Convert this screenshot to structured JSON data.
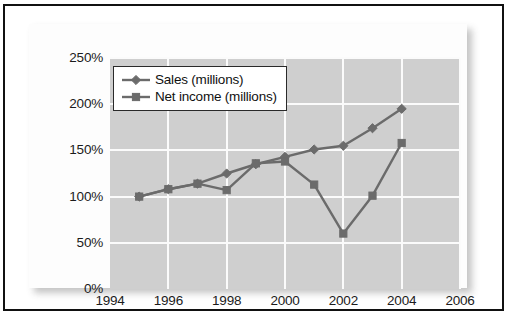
{
  "chart_data": {
    "type": "line",
    "title": "",
    "subtitle": "",
    "xlabel": "",
    "ylabel": "",
    "x": [
      1995,
      1996,
      1997,
      1998,
      1999,
      2000,
      2001,
      2002,
      2003,
      2004
    ],
    "xlim": [
      1994,
      2006
    ],
    "ylim": [
      0,
      250
    ],
    "xticks": [
      "1994",
      "1996",
      "1998",
      "2000",
      "2002",
      "2004",
      "2006"
    ],
    "xtick_values": [
      1994,
      1996,
      1998,
      2000,
      2002,
      2004,
      2006
    ],
    "yticks": [
      "0%",
      "50%",
      "100%",
      "150%",
      "200%",
      "250%"
    ],
    "ytick_values": [
      0,
      50,
      100,
      150,
      200,
      250
    ],
    "grid": true,
    "grid_color": "#fbfbfb",
    "plot_background": "#cfcfcf",
    "legend_position": "top-left",
    "series": [
      {
        "name": "Sales (millions)",
        "marker": "diamond",
        "color": "#6b6b6b",
        "values": [
          100,
          108,
          114,
          125,
          135,
          143,
          151,
          155,
          174,
          195
        ]
      },
      {
        "name": "Net income (millions)",
        "marker": "square",
        "color": "#6b6b6b",
        "values": [
          100,
          108,
          114,
          107,
          136,
          138,
          113,
          60,
          101,
          158
        ]
      }
    ]
  },
  "chart": {
    "legend": {
      "entries": [
        {
          "label": "Sales (millions)",
          "marker": "diamond"
        },
        {
          "label": "Net income (millions)",
          "marker": "square"
        }
      ]
    }
  }
}
